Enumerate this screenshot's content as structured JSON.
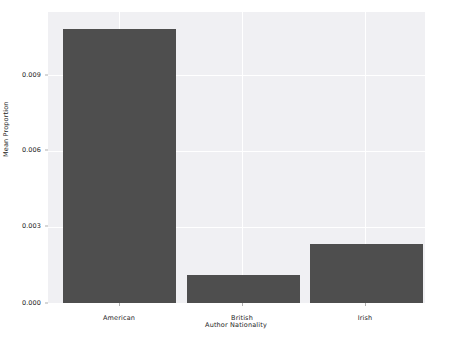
{
  "chart_data": {
    "type": "bar",
    "title": "",
    "xlabel": "Author Nationality",
    "ylabel": "Mean Proportion",
    "categories": [
      "American",
      "British",
      "Irish"
    ],
    "values": [
      0.01082,
      0.00111,
      0.00233
    ],
    "ylim": [
      0.0,
      0.01149
    ],
    "xlim": [
      -0.5,
      2.5
    ],
    "yticks": [
      "0.000",
      "0.003",
      "0.006",
      "0.009"
    ],
    "ytick_values": [
      0.0,
      0.003,
      0.006,
      0.009
    ],
    "grid": true,
    "grid_color": "#ffffff",
    "legend": null,
    "bar_color": "#4e4e4e",
    "plot_background": "#f0f0f3",
    "figure_background": "#ffffff"
  },
  "axes": {
    "y_label": "Mean Proportion",
    "x_label": "Author Nationality",
    "y_ticks": [
      {
        "label": "0.000"
      },
      {
        "label": "0.003"
      },
      {
        "label": "0.006"
      },
      {
        "label": "0.009"
      }
    ],
    "x_ticks": [
      {
        "label": "American"
      },
      {
        "label": "British"
      },
      {
        "label": "Irish"
      }
    ]
  }
}
